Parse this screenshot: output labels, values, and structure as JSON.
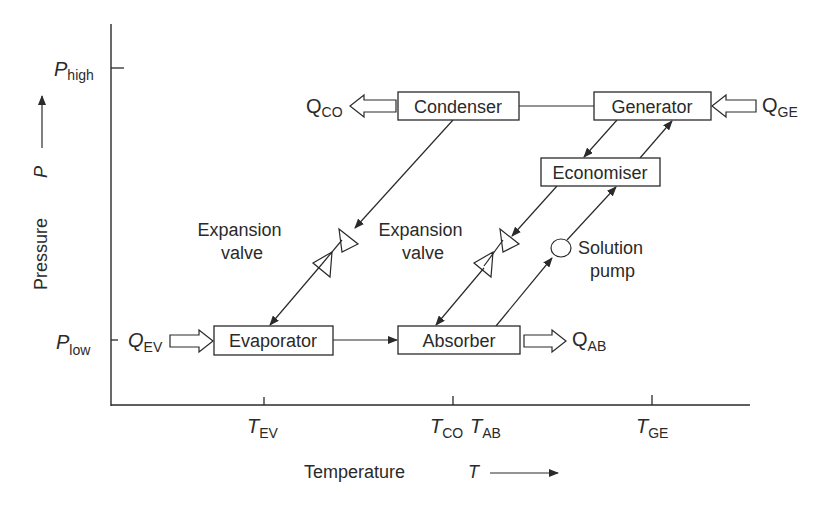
{
  "diagram": {
    "type": "absorption refrigeration cycle on pressure-temperature plane",
    "axes": {
      "y": {
        "label": "Pressure",
        "symbol": "P",
        "ticks": [
          {
            "main": "P",
            "sub": "high"
          },
          {
            "main": "P",
            "sub": "low"
          }
        ]
      },
      "x": {
        "label": "Temperature",
        "symbol": "T",
        "ticks": [
          {
            "main": "T",
            "sub": "EV"
          },
          {
            "main": "T",
            "sub": "CO"
          },
          {
            "main": "T",
            "sub": "AB"
          },
          {
            "main": "T",
            "sub": "GE"
          }
        ]
      }
    },
    "components": {
      "condenser": "Condenser",
      "generator": "Generator",
      "economiser": "Economiser",
      "evaporator": "Evaporator",
      "absorber": "Absorber"
    },
    "devices": {
      "expansion_valve_1": [
        "Expansion",
        "valve"
      ],
      "expansion_valve_2": [
        "Expansion",
        "valve"
      ],
      "solution_pump": [
        "Solution",
        "pump"
      ]
    },
    "heat_flows": {
      "q_co": {
        "main": "Q",
        "sub": "CO"
      },
      "q_ge": {
        "main": "Q",
        "sub": "GE"
      },
      "q_ev": {
        "main": "Q",
        "sub": "EV"
      },
      "q_ab": {
        "main": "Q",
        "sub": "AB"
      }
    }
  }
}
